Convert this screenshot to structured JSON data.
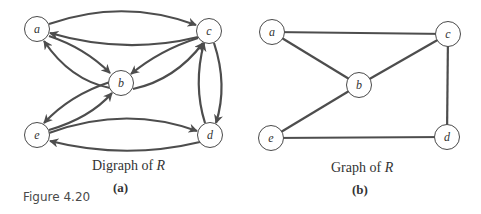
{
  "figure_label": "Figure 4.20",
  "panels": [
    {
      "id": "a",
      "type": "digraph",
      "caption_prefix": "Digraph of ",
      "caption_var": "R",
      "sublabel": "(a)",
      "nodes": [
        {
          "id": "a",
          "label": "a",
          "x": 37,
          "y": 29
        },
        {
          "id": "b",
          "label": "b",
          "x": 121,
          "y": 83
        },
        {
          "id": "c",
          "label": "c",
          "x": 209,
          "y": 31
        },
        {
          "id": "d",
          "label": "d",
          "x": 210,
          "y": 135
        },
        {
          "id": "e",
          "label": "e",
          "x": 37,
          "y": 135
        }
      ],
      "edges": [
        {
          "from": "a",
          "to": "c"
        },
        {
          "from": "c",
          "to": "a"
        },
        {
          "from": "a",
          "to": "b"
        },
        {
          "from": "b",
          "to": "a"
        },
        {
          "from": "c",
          "to": "b"
        },
        {
          "from": "b",
          "to": "c"
        },
        {
          "from": "b",
          "to": "e"
        },
        {
          "from": "e",
          "to": "b"
        },
        {
          "from": "e",
          "to": "d"
        },
        {
          "from": "d",
          "to": "e"
        },
        {
          "from": "c",
          "to": "d"
        },
        {
          "from": "d",
          "to": "c"
        }
      ]
    },
    {
      "id": "b",
      "type": "graph",
      "caption_prefix": "Graph of ",
      "caption_var": "R",
      "sublabel": "(b)",
      "nodes": [
        {
          "id": "a",
          "label": "a",
          "x": 272,
          "y": 32
        },
        {
          "id": "b",
          "label": "b",
          "x": 359,
          "y": 85
        },
        {
          "id": "c",
          "label": "c",
          "x": 448,
          "y": 34
        },
        {
          "id": "d",
          "label": "d",
          "x": 447,
          "y": 137
        },
        {
          "id": "e",
          "label": "e",
          "x": 271,
          "y": 138
        }
      ],
      "edges": [
        {
          "from": "a",
          "to": "c"
        },
        {
          "from": "a",
          "to": "b"
        },
        {
          "from": "b",
          "to": "c"
        },
        {
          "from": "b",
          "to": "e"
        },
        {
          "from": "c",
          "to": "d"
        },
        {
          "from": "e",
          "to": "d"
        }
      ]
    }
  ]
}
